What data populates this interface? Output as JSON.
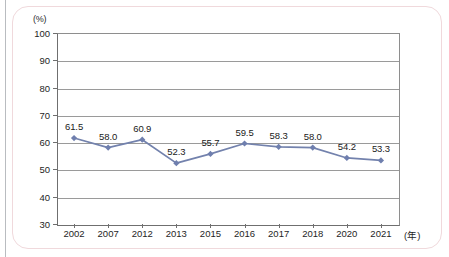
{
  "figure": {
    "axis_unit_y": "(%)",
    "axis_unit_x": "(年)"
  },
  "chart_data": {
    "type": "line",
    "title": "",
    "subtitle": "",
    "xlabel": "(年)",
    "ylabel": "(%)",
    "categories": [
      "2002",
      "2007",
      "2012",
      "2013",
      "2015",
      "2016",
      "2017",
      "2018",
      "2020",
      "2021"
    ],
    "values": [
      61.5,
      58.0,
      60.9,
      52.3,
      55.7,
      59.5,
      58.3,
      58.0,
      54.2,
      53.3
    ],
    "point_labels": [
      "61.5",
      "58.0",
      "60.9",
      "52.3",
      "55.7",
      "59.5",
      "58.3",
      "58.0",
      "54.2",
      "53.3"
    ],
    "ylim": [
      30,
      100
    ],
    "yticks": [
      100,
      90,
      80,
      70,
      60,
      50,
      40,
      30
    ],
    "ytick_labels": [
      "100",
      "90",
      "80",
      "70",
      "60",
      "50",
      "40",
      "30"
    ],
    "grid": true,
    "grid_axis": "y",
    "legend": null,
    "legend_position": "none",
    "series": [
      {
        "name": "",
        "values": [
          61.5,
          58.0,
          60.9,
          52.3,
          55.7,
          59.5,
          58.3,
          58.0,
          54.2,
          53.3
        ],
        "color": "#7382ad",
        "marker": "diamond",
        "marker_color": "#6f7fae"
      }
    ],
    "colors": {
      "line": "#7382ad",
      "marker": "#6f7fae",
      "grid": "#9a9a9a",
      "axis": "#6f6f6f",
      "text": "#1a1a1a",
      "frame": "#f0d9dc"
    }
  }
}
